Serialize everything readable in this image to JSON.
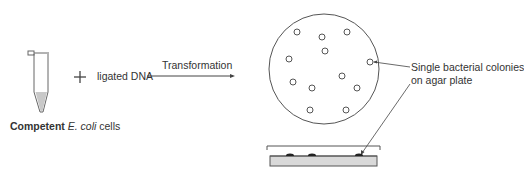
{
  "diagram": {
    "tube_label_bold": "Competent",
    "tube_label_italic": "E. coli",
    "tube_label_rest": "cells",
    "plus_sign": "+",
    "dna_label": "ligated DNA",
    "arrow_label": "Transformation",
    "colonies_label_line1": "Single bacterial colonies",
    "colonies_label_line2": "on agar plate"
  },
  "colors": {
    "line": "#555555",
    "agar_fill": "#d9d9d9",
    "tube_fill": "#c8c8c8",
    "colony": "#222222"
  }
}
